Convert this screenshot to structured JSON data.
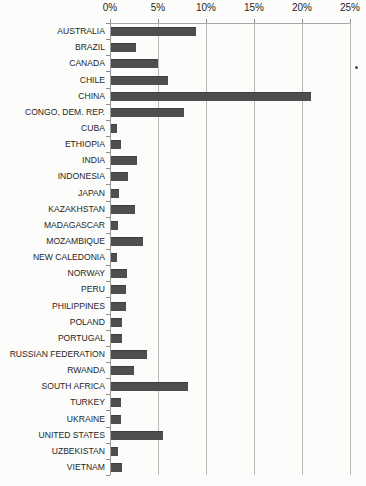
{
  "chart_data": {
    "type": "bar",
    "orientation": "horizontal",
    "title": "",
    "xlabel": "",
    "ylabel": "",
    "xlim": [
      0,
      25
    ],
    "grid": true,
    "legend": "none",
    "bar_color": "#4e4e4e",
    "axis_tick_format": "percent",
    "x_ticks": [
      {
        "value": 0,
        "label": "0%"
      },
      {
        "value": 5,
        "label": "5%"
      },
      {
        "value": 10,
        "label": "10%"
      },
      {
        "value": 15,
        "label": "15%"
      },
      {
        "value": 20,
        "label": "20%"
      },
      {
        "value": 25,
        "label": "25%"
      }
    ],
    "categories": [
      "AUSTRALIA",
      "BRAZIL",
      "CANADA",
      "CHILE",
      "CHINA",
      "CONGO, DEM. REP.",
      "CUBA",
      "ETHIOPIA",
      "INDIA",
      "INDONESIA",
      "JAPAN",
      "KAZAKHSTAN",
      "MADAGASCAR",
      "MOZAMBIQUE",
      "NEW CALEDONIA",
      "NORWAY",
      "PERU",
      "PHILIPPINES",
      "POLAND",
      "PORTUGAL",
      "RUSSIAN FEDERATION",
      "RWANDA",
      "SOUTH AFRICA",
      "TURKEY",
      "UKRAINE",
      "UNITED STATES",
      "UZBEKISTAN",
      "VIETNAM"
    ],
    "values": [
      8.9,
      2.6,
      4.9,
      5.9,
      20.8,
      7.6,
      0.6,
      1.0,
      2.7,
      1.8,
      0.8,
      2.5,
      0.7,
      3.3,
      0.6,
      1.7,
      1.6,
      1.6,
      1.1,
      1.1,
      3.7,
      2.4,
      8.0,
      1.0,
      1.0,
      5.4,
      0.7,
      1.1
    ]
  }
}
